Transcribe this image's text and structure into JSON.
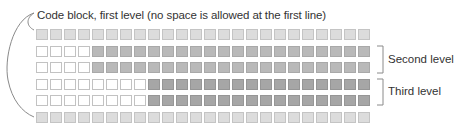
{
  "diagram": {
    "title_label": "Code block, first level (no space is allowed at the first line)",
    "columns": 24,
    "rows": [
      {
        "name": "first-level-top",
        "indent": 0,
        "fill": "light"
      },
      {
        "name": "second-level-1",
        "indent": 4,
        "fill": "mid"
      },
      {
        "name": "second-level-2",
        "indent": 4,
        "fill": "mid"
      },
      {
        "name": "third-level-1",
        "indent": 8,
        "fill": "dark"
      },
      {
        "name": "third-level-2",
        "indent": 8,
        "fill": "dark"
      },
      {
        "name": "first-level-bottom",
        "indent": 0,
        "fill": "light"
      }
    ],
    "brackets": [
      {
        "label": "Second level",
        "rows": [
          2,
          3
        ]
      },
      {
        "label": "Third level",
        "rows": [
          4,
          5
        ]
      }
    ],
    "colors": {
      "light": "#dcdcdc",
      "mid": "#b9b9b9",
      "dark": "#a6a6a6",
      "white": "#ffffff",
      "line": "#888888"
    }
  }
}
